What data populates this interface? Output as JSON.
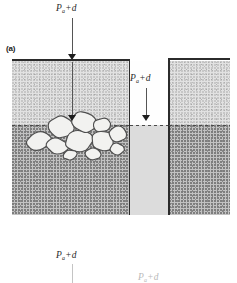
{
  "figure": {
    "panel_label": "(a)",
    "width": 237,
    "height": 283,
    "background_color": "#ffffff"
  },
  "labels": {
    "symbol": "P",
    "subscript": "a",
    "operator": "+",
    "term": "d",
    "top_center": "Pₐ + d",
    "channel": "Pₐ + d",
    "bottom_left": "Pₐ + d",
    "bottom_right_faint": "Pₐ + d"
  },
  "colors": {
    "ink": "#2b2b2b",
    "arrow": "#555555",
    "arrow_head": "#1e1e1e",
    "gas_region": "#e2e2e2",
    "liquid_region": "#c2c2c2",
    "channel_upper": "#fefefe",
    "channel_lower": "#dcdcdc",
    "bubble_fill": "#f2f2f0",
    "bubble_stroke": "#4e4e4e",
    "faint_ink": "#c4c4c4"
  },
  "geometry": {
    "left_block": {
      "x": 12,
      "y": 60,
      "width": 118,
      "height": 155
    },
    "right_block": {
      "x": 168,
      "y": 60,
      "width": 62,
      "height": 155
    },
    "channel": {
      "x": 130,
      "y": 60,
      "width": 38,
      "height": 155
    },
    "interface_y": 125,
    "vessel_top_y": 60,
    "vessel_bottom_y": 215
  },
  "arrows": [
    {
      "name": "top-center-pressure-arrow",
      "x": 72,
      "y_start": 18,
      "y_end": 62,
      "head_y": 58
    },
    {
      "name": "interior-pressure-arrow",
      "x": 72,
      "y_start": 62,
      "y_end": 126,
      "head_y": 118
    },
    {
      "name": "channel-pressure-arrow",
      "x": 146,
      "y_start": 88,
      "y_end": 126,
      "head_y": 118
    },
    {
      "name": "bottom-left-pressure-arrow",
      "x": 72,
      "y_start": 262,
      "y_end": 283
    },
    {
      "name": "bottom-right-pressure-arrow",
      "x": 150,
      "y_start": 280,
      "y_end": 283
    }
  ],
  "bubbles": {
    "count": 11,
    "description": "cluster of irregular rounded bubbles resting at the interface on the left side",
    "shapes": [
      {
        "cx": 39,
        "cy": 141,
        "rx": 13,
        "ry": 9,
        "rot": -18
      },
      {
        "cx": 61,
        "cy": 127,
        "rx": 13,
        "ry": 11,
        "rot": 8
      },
      {
        "cx": 57,
        "cy": 146,
        "rx": 11,
        "ry": 8,
        "rot": 12
      },
      {
        "cx": 79,
        "cy": 141,
        "rx": 14,
        "ry": 11,
        "rot": -6
      },
      {
        "cx": 84,
        "cy": 122,
        "rx": 13,
        "ry": 10,
        "rot": 20
      },
      {
        "cx": 102,
        "cy": 125,
        "rx": 9,
        "ry": 7,
        "rot": -10
      },
      {
        "cx": 103,
        "cy": 141,
        "rx": 12,
        "ry": 10,
        "rot": 14
      },
      {
        "cx": 118,
        "cy": 134,
        "rx": 9,
        "ry": 8,
        "rot": -4
      },
      {
        "cx": 93,
        "cy": 154,
        "rx": 8,
        "ry": 6,
        "rot": 6
      },
      {
        "cx": 70,
        "cy": 155,
        "rx": 7,
        "ry": 5,
        "rot": -14
      },
      {
        "cx": 117,
        "cy": 149,
        "rx": 7,
        "ry": 6,
        "rot": 10
      }
    ]
  }
}
